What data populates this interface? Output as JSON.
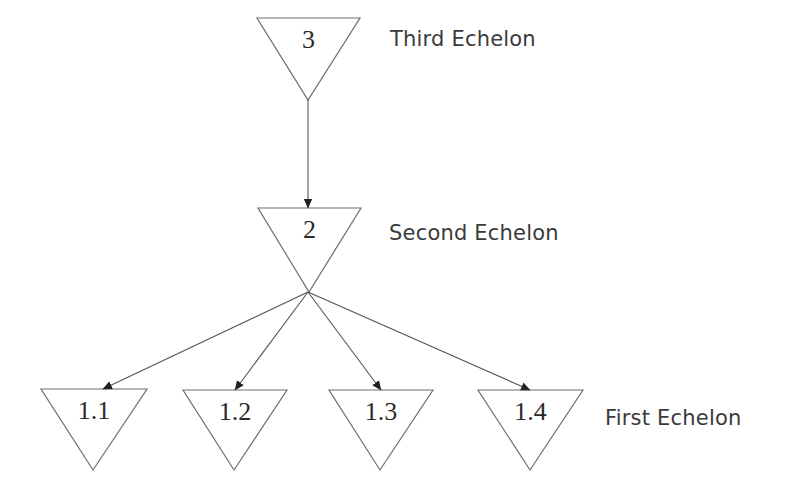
{
  "diagram": {
    "type": "hierarchy",
    "echelons": [
      {
        "label": "Third Echelon",
        "x": 390,
        "y": 27
      },
      {
        "label": "Second Echelon",
        "x": 389,
        "y": 221
      },
      {
        "label": "First Echelon",
        "x": 605,
        "y": 406
      }
    ],
    "nodes": [
      {
        "id": "3",
        "label": "3",
        "echelon": "Third Echelon",
        "left": 257,
        "right": 360,
        "top": 18,
        "apex_x": 308,
        "apex_y": 100
      },
      {
        "id": "2",
        "label": "2",
        "echelon": "Second Echelon",
        "left": 258,
        "right": 361,
        "top": 208,
        "apex_x": 309,
        "apex_y": 292
      },
      {
        "id": "1.1",
        "label": "1.1",
        "echelon": "First Echelon",
        "left": 41,
        "right": 147,
        "top": 389,
        "apex_x": 93,
        "apex_y": 470
      },
      {
        "id": "1.2",
        "label": "1.2",
        "echelon": "First Echelon",
        "left": 183,
        "right": 287,
        "top": 390,
        "apex_x": 234,
        "apex_y": 470
      },
      {
        "id": "1.3",
        "label": "1.3",
        "echelon": "First Echelon",
        "left": 329,
        "right": 433,
        "top": 390,
        "apex_x": 380,
        "apex_y": 470
      },
      {
        "id": "1.4",
        "label": "1.4",
        "echelon": "First Echelon",
        "left": 478,
        "right": 583,
        "top": 390,
        "apex_x": 530,
        "apex_y": 470
      }
    ],
    "edges": [
      {
        "from": "3",
        "to": "2",
        "x1": 308,
        "y1": 100,
        "x2": 308,
        "y2": 208
      },
      {
        "from": "2",
        "to": "1.1",
        "x1": 308,
        "y1": 292,
        "x2": 103,
        "y2": 389
      },
      {
        "from": "2",
        "to": "1.2",
        "x1": 308,
        "y1": 292,
        "x2": 235,
        "y2": 390
      },
      {
        "from": "2",
        "to": "1.3",
        "x1": 308,
        "y1": 292,
        "x2": 381,
        "y2": 390
      },
      {
        "from": "2",
        "to": "1.4",
        "x1": 308,
        "y1": 292,
        "x2": 530,
        "y2": 390
      }
    ],
    "colors": {
      "background": "#ffffff",
      "stroke": "#6e6e6e",
      "text": "#2a2a2a"
    }
  }
}
